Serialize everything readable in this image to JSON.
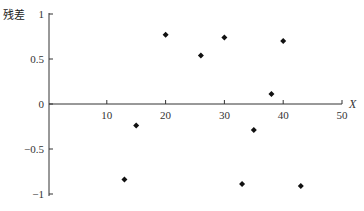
{
  "chart_data": {
    "type": "scatter",
    "title": "",
    "xlabel": "X",
    "ylabel": "残差",
    "xlim": [
      0,
      50
    ],
    "ylim": [
      -1,
      1
    ],
    "x_ticks": [
      10,
      20,
      30,
      40,
      50
    ],
    "y_ticks": [
      1,
      0.5,
      0,
      -0.5,
      -1
    ],
    "y_tick_labels": [
      "1",
      "0.5",
      "0",
      "−0.5",
      "−1"
    ],
    "grid": false,
    "legend": null,
    "marker": "diamond",
    "series": [
      {
        "name": "残差",
        "points": [
          {
            "x": 13,
            "y": -0.84
          },
          {
            "x": 15,
            "y": -0.24
          },
          {
            "x": 20,
            "y": 0.77
          },
          {
            "x": 26,
            "y": 0.54
          },
          {
            "x": 30,
            "y": 0.74
          },
          {
            "x": 33,
            "y": -0.89
          },
          {
            "x": 35,
            "y": -0.29
          },
          {
            "x": 38,
            "y": 0.11
          },
          {
            "x": 40,
            "y": 0.7
          },
          {
            "x": 43,
            "y": -0.91
          }
        ]
      }
    ]
  },
  "colors": {
    "axis": "#333333",
    "marker": "#111111"
  }
}
